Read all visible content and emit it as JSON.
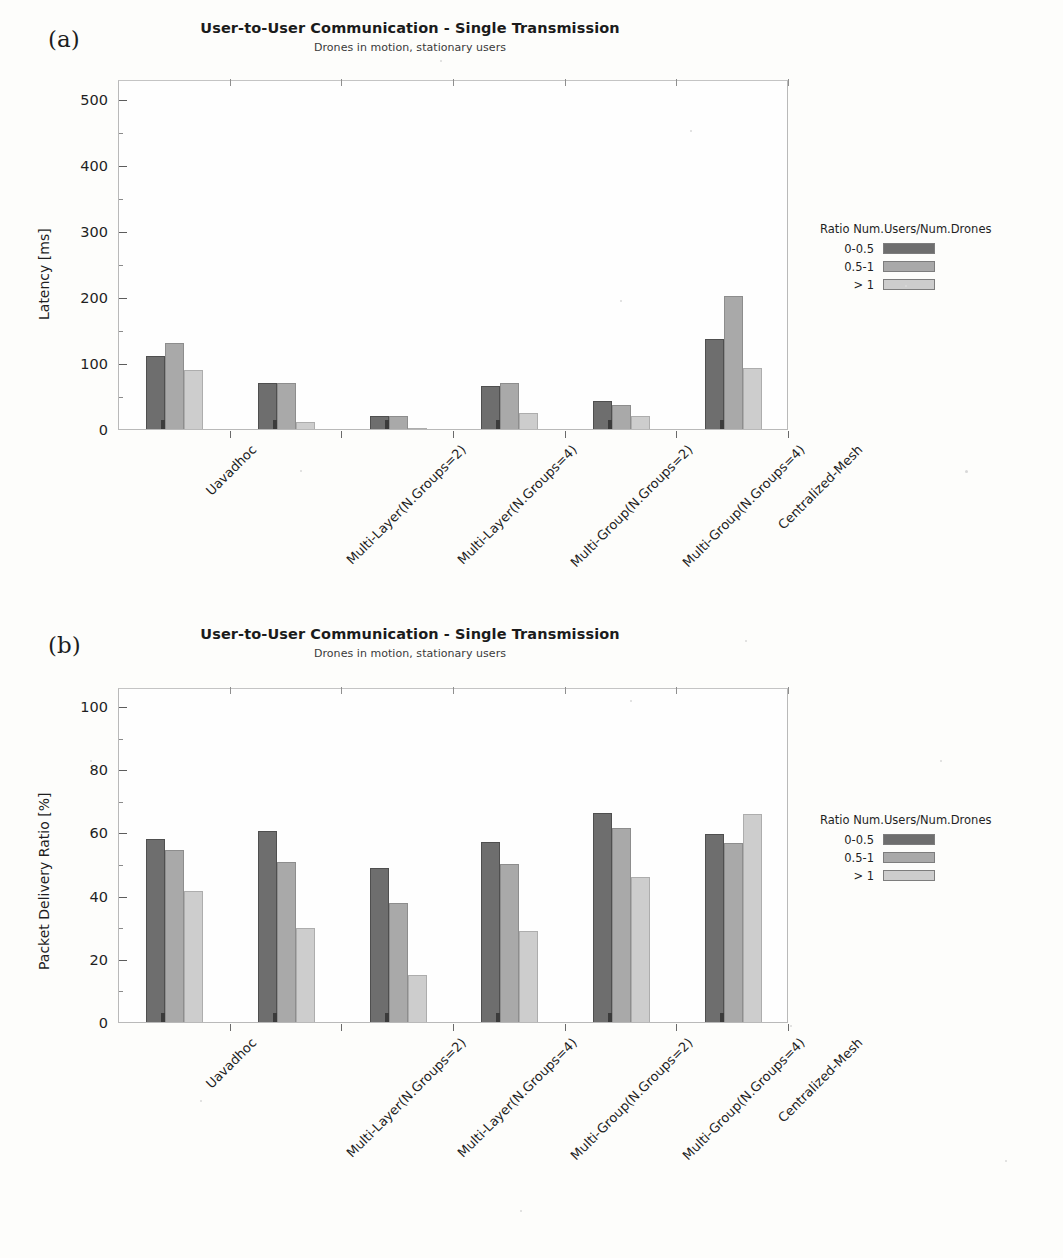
{
  "figure": {
    "panels": [
      {
        "letter": "(a)",
        "title": "User-to-User Communication - Single Transmission",
        "subtitle": "Drones in motion, stationary users"
      },
      {
        "letter": "(b)",
        "title": "User-to-User Communication - Single Transmission",
        "subtitle": "Drones in motion, stationary users"
      }
    ]
  },
  "legend": {
    "title": "Ratio Num.Users/Num.Drones",
    "entries": [
      "0-0.5",
      "0.5-1",
      "> 1"
    ]
  },
  "colors": {
    "series_0": "#6e6e6e",
    "series_1": "#a9a9a9",
    "series_2": "#cdcdcd",
    "axis": "#b9b9b9",
    "background": "#fdfdfb"
  },
  "chart_data": [
    {
      "type": "bar",
      "panel": "(a)",
      "title": "User-to-User Communication - Single Transmission",
      "subtitle": "Drones in motion, stationary users",
      "xlabel": "",
      "ylabel": "Latency [ms]",
      "ylim": [
        0,
        530
      ],
      "yticks": [
        0,
        100,
        200,
        300,
        400,
        500
      ],
      "ytick_labels": [
        "0",
        "100",
        "200",
        "300",
        "400",
        "500"
      ],
      "grid": false,
      "legend_position": "right",
      "legend_title": "Ratio Num.Users/Num.Drones",
      "categories": [
        "Uavadhoc",
        "Multi-Layer(N.Groups=2)",
        "Multi-Layer(N.Groups=4)",
        "Multi-Group(N.Groups=2)",
        "Multi-Group(N.Groups=4)",
        "Centralized-Mesh"
      ],
      "series": [
        {
          "name": "0-0.5",
          "values": [
            110,
            70,
            19,
            65,
            42,
            136
          ]
        },
        {
          "name": "0.5-1",
          "values": [
            130,
            69,
            19,
            70,
            37,
            201
          ]
        },
        {
          "name": "> 1",
          "values": [
            90,
            11,
            1,
            25,
            20,
            92
          ]
        }
      ]
    },
    {
      "type": "bar",
      "panel": "(b)",
      "title": "User-to-User Communication - Single Transmission",
      "subtitle": "Drones in motion, stationary users",
      "xlabel": "",
      "ylabel": "Packet Delivery Ratio [%]",
      "ylim": [
        0,
        106
      ],
      "yticks": [
        0,
        20,
        40,
        60,
        80,
        100
      ],
      "ytick_labels": [
        "0",
        "20",
        "40",
        "60",
        "80",
        "100"
      ],
      "grid": false,
      "legend_position": "right",
      "legend_title": "Ratio Num.Users/Num.Drones",
      "categories": [
        "Uavadhoc",
        "Multi-Layer(N.Groups=2)",
        "Multi-Layer(N.Groups=4)",
        "Multi-Group(N.Groups=2)",
        "Multi-Group(N.Groups=4)",
        "Centralized-Mesh"
      ],
      "series": [
        {
          "name": "0-0.5",
          "values": [
            58.0,
            60.5,
            48.7,
            57.0,
            66.0,
            59.5
          ]
        },
        {
          "name": "0.5-1",
          "values": [
            54.3,
            50.5,
            37.7,
            49.9,
            61.3,
            56.5
          ]
        },
        {
          "name": "> 1",
          "values": [
            41.5,
            29.7,
            15.0,
            28.9,
            45.8,
            65.8
          ]
        }
      ]
    }
  ]
}
